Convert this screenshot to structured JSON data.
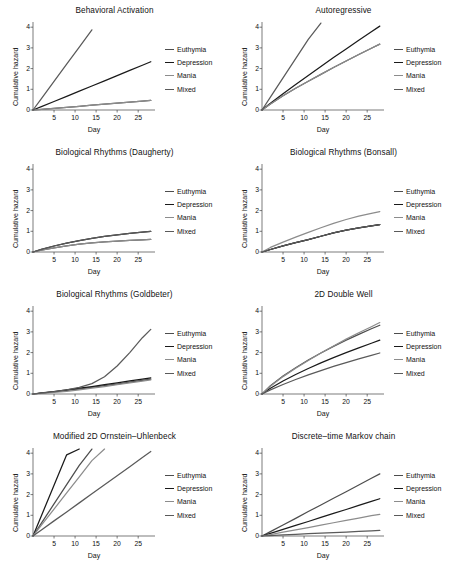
{
  "figure": {
    "width": 458,
    "height": 570,
    "background": "#ffffff"
  },
  "series_colors": {
    "Euthymia": "#4d4d4d",
    "Depression": "#1a1a1a",
    "Mania": "#8c8c8c",
    "Mixed": "#5a5a5a"
  },
  "legend": {
    "position": "right",
    "entries": [
      "Euthymia",
      "Depression",
      "Mania",
      "Mixed"
    ]
  },
  "axes": {
    "xlabel": "Day",
    "ylabel": "Cumulative hazard",
    "xticks": [
      5,
      10,
      15,
      20,
      25
    ],
    "yticks": [
      0,
      1,
      2,
      3,
      4
    ],
    "xlim": [
      0,
      29
    ],
    "ylim": [
      0,
      4.25
    ],
    "grid": false
  },
  "chart_data": [
    {
      "type": "line",
      "title": "Behavioral Activation",
      "xlabel": "Day",
      "ylabel": "Cumulative hazard",
      "xlim": [
        0,
        29
      ],
      "ylim": [
        0,
        4.25
      ],
      "xticks": [
        5,
        10,
        15,
        20,
        25
      ],
      "yticks": [
        0,
        1,
        2,
        3,
        4
      ],
      "grid": false,
      "legend": [
        "Euthymia",
        "Depression",
        "Mania",
        "Mixed"
      ],
      "x": [
        0,
        2,
        5,
        8,
        11,
        14,
        17,
        20,
        23,
        26,
        28
      ],
      "series": [
        {
          "name": "Euthymia",
          "values": [
            0,
            0.03,
            0.08,
            0.13,
            0.18,
            0.23,
            0.28,
            0.33,
            0.38,
            0.43,
            0.46
          ]
        },
        {
          "name": "Depression",
          "values": [
            0,
            0.16,
            0.41,
            0.66,
            0.91,
            1.16,
            1.41,
            1.66,
            1.91,
            2.16,
            2.33
          ]
        },
        {
          "name": "Mania",
          "values": [
            0,
            0.03,
            0.08,
            0.13,
            0.18,
            0.23,
            0.28,
            0.33,
            0.38,
            0.43,
            0.46
          ]
        },
        {
          "name": "Mixed",
          "values": [
            0,
            0.55,
            1.38,
            2.21,
            3.04,
            3.87,
            null,
            null,
            null,
            null,
            null
          ]
        }
      ]
    },
    {
      "type": "line",
      "title": "Autoregressive",
      "xlabel": "Day",
      "ylabel": "Cumulative hazard",
      "xlim": [
        0,
        29
      ],
      "ylim": [
        0,
        4.25
      ],
      "xticks": [
        5,
        10,
        15,
        20,
        25
      ],
      "yticks": [
        0,
        1,
        2,
        3,
        4
      ],
      "grid": false,
      "legend": [
        "Euthymia",
        "Depression",
        "Mania",
        "Mixed"
      ],
      "x": [
        0,
        2,
        5,
        8,
        11,
        14,
        17,
        20,
        23,
        26,
        28
      ],
      "series": [
        {
          "name": "Euthymia",
          "values": [
            0,
            0.29,
            0.69,
            1.05,
            1.39,
            1.72,
            2.05,
            2.37,
            2.68,
            2.98,
            3.18
          ]
        },
        {
          "name": "Depression",
          "values": [
            0,
            0.33,
            0.79,
            1.23,
            1.67,
            2.1,
            2.53,
            2.95,
            3.37,
            3.78,
            4.05
          ]
        },
        {
          "name": "Mania",
          "values": [
            0,
            0.29,
            0.69,
            1.05,
            1.39,
            1.72,
            2.05,
            2.37,
            2.68,
            2.98,
            3.18
          ]
        },
        {
          "name": "Mixed",
          "values": [
            0,
            0.62,
            1.55,
            2.48,
            3.41,
            4.2,
            null,
            null,
            null,
            null,
            null
          ]
        }
      ]
    },
    {
      "type": "line",
      "title": "Biological Rhythms (Daugherty)",
      "xlabel": "Day",
      "ylabel": "Cumulative hazard",
      "xlim": [
        0,
        29
      ],
      "ylim": [
        0,
        4.25
      ],
      "xticks": [
        5,
        10,
        15,
        20,
        25
      ],
      "yticks": [
        0,
        1,
        2,
        3,
        4
      ],
      "grid": false,
      "legend": [
        "Euthymia",
        "Depression",
        "Mania",
        "Mixed"
      ],
      "x": [
        0,
        2,
        5,
        8,
        11,
        14,
        17,
        20,
        23,
        26,
        28
      ],
      "series": [
        {
          "name": "Euthymia",
          "values": [
            0,
            0.09,
            0.2,
            0.3,
            0.38,
            0.44,
            0.49,
            0.53,
            0.56,
            0.59,
            0.61
          ]
        },
        {
          "name": "Depression",
          "values": [
            0,
            0.13,
            0.29,
            0.43,
            0.55,
            0.66,
            0.75,
            0.83,
            0.9,
            0.96,
            1.0
          ]
        },
        {
          "name": "Mania",
          "values": [
            0,
            0.09,
            0.2,
            0.3,
            0.38,
            0.44,
            0.49,
            0.53,
            0.56,
            0.59,
            0.61
          ]
        },
        {
          "name": "Mixed",
          "values": [
            0,
            0.13,
            0.29,
            0.43,
            0.55,
            0.66,
            0.75,
            0.83,
            0.9,
            0.96,
            1.0
          ]
        }
      ]
    },
    {
      "type": "line",
      "title": "Biological Rhythms (Bonsall)",
      "xlabel": "Day",
      "ylabel": "Cumulative hazard",
      "xlim": [
        0,
        29
      ],
      "ylim": [
        0,
        4.25
      ],
      "xticks": [
        5,
        10,
        15,
        20,
        25
      ],
      "yticks": [
        0,
        1,
        2,
        3,
        4
      ],
      "grid": false,
      "legend": [
        "Euthymia",
        "Depression",
        "Mania",
        "Mixed"
      ],
      "x": [
        0,
        2,
        5,
        8,
        11,
        14,
        17,
        20,
        23,
        26,
        28
      ],
      "series": [
        {
          "name": "Euthymia",
          "values": [
            0,
            0.12,
            0.3,
            0.45,
            0.6,
            0.76,
            0.92,
            1.06,
            1.17,
            1.26,
            1.32
          ]
        },
        {
          "name": "Depression",
          "values": [
            0,
            0.12,
            0.3,
            0.45,
            0.6,
            0.76,
            0.92,
            1.06,
            1.17,
            1.26,
            1.32
          ]
        },
        {
          "name": "Mania",
          "values": [
            0,
            0.22,
            0.48,
            0.72,
            0.95,
            1.17,
            1.38,
            1.57,
            1.73,
            1.87,
            1.95
          ]
        },
        {
          "name": "Mixed",
          "values": [
            0,
            0.12,
            0.3,
            0.45,
            0.6,
            0.76,
            0.92,
            1.06,
            1.17,
            1.26,
            1.32
          ]
        }
      ]
    },
    {
      "type": "line",
      "title": "Biological Rhythms (Goldbeter)",
      "xlabel": "Day",
      "ylabel": "Cumulative hazard",
      "xlim": [
        0,
        29
      ],
      "ylim": [
        0,
        4.25
      ],
      "xticks": [
        5,
        10,
        15,
        20,
        25
      ],
      "yticks": [
        0,
        1,
        2,
        3,
        4
      ],
      "grid": false,
      "legend": [
        "Euthymia",
        "Depression",
        "Mania",
        "Mixed"
      ],
      "x": [
        0,
        2,
        5,
        8,
        11,
        14,
        17,
        20,
        23,
        26,
        28
      ],
      "series": [
        {
          "name": "Euthymia",
          "values": [
            0,
            0.04,
            0.1,
            0.17,
            0.24,
            0.32,
            0.4,
            0.48,
            0.57,
            0.66,
            0.72
          ]
        },
        {
          "name": "Depression",
          "values": [
            0,
            0.05,
            0.12,
            0.2,
            0.28,
            0.36,
            0.45,
            0.54,
            0.63,
            0.72,
            0.78
          ]
        },
        {
          "name": "Mania",
          "values": [
            0,
            0.03,
            0.08,
            0.13,
            0.2,
            0.28,
            0.36,
            0.45,
            0.54,
            0.62,
            0.68
          ]
        },
        {
          "name": "Mixed",
          "values": [
            0,
            0.04,
            0.11,
            0.2,
            0.32,
            0.5,
            0.83,
            1.35,
            2.0,
            2.72,
            3.12
          ]
        }
      ]
    },
    {
      "type": "line",
      "title": "2D Double Well",
      "xlabel": "Day",
      "ylabel": "Cumulative hazard",
      "xlim": [
        0,
        29
      ],
      "ylim": [
        0,
        4.25
      ],
      "xticks": [
        5,
        10,
        15,
        20,
        25
      ],
      "yticks": [
        0,
        1,
        2,
        3,
        4
      ],
      "grid": false,
      "legend": [
        "Euthymia",
        "Depression",
        "Mania",
        "Mixed"
      ],
      "x": [
        0,
        2,
        5,
        8,
        11,
        14,
        17,
        20,
        23,
        26,
        28
      ],
      "series": [
        {
          "name": "Euthymia",
          "values": [
            0,
            0.4,
            0.87,
            1.27,
            1.64,
            1.98,
            2.3,
            2.6,
            2.88,
            3.15,
            3.32
          ]
        },
        {
          "name": "Depression",
          "values": [
            0,
            0.28,
            0.63,
            0.94,
            1.23,
            1.5,
            1.76,
            2.0,
            2.23,
            2.45,
            2.6
          ]
        },
        {
          "name": "Mania",
          "values": [
            0,
            0.38,
            0.84,
            1.24,
            1.62,
            1.98,
            2.32,
            2.65,
            2.96,
            3.25,
            3.45
          ]
        },
        {
          "name": "Mixed",
          "values": [
            0,
            0.2,
            0.46,
            0.7,
            0.92,
            1.13,
            1.33,
            1.52,
            1.7,
            1.87,
            1.98
          ]
        }
      ]
    },
    {
      "type": "line",
      "title": "Modified 2D Ornstein–Uhlenbeck",
      "xlabel": "Day",
      "ylabel": "Cumulative hazard",
      "xlim": [
        0,
        29
      ],
      "ylim": [
        0,
        4.25
      ],
      "xticks": [
        5,
        10,
        15,
        20,
        25
      ],
      "yticks": [
        0,
        1,
        2,
        3,
        4
      ],
      "grid": false,
      "legend": [
        "Euthymia",
        "Depression",
        "Mania",
        "Mixed"
      ],
      "x": [
        0,
        2,
        5,
        8,
        11,
        14,
        17,
        20,
        23,
        26,
        28
      ],
      "series": [
        {
          "name": "Euthymia",
          "values": [
            0,
            0.62,
            1.55,
            2.48,
            3.41,
            4.2,
            null,
            null,
            null,
            null,
            null
          ]
        },
        {
          "name": "Depression",
          "values": [
            0,
            0.98,
            2.45,
            3.92,
            4.2,
            null,
            null,
            null,
            null,
            null,
            null
          ]
        },
        {
          "name": "Mania",
          "values": [
            0,
            0.52,
            1.3,
            2.08,
            2.86,
            3.64,
            4.2,
            null,
            null,
            null,
            null
          ]
        },
        {
          "name": "Mixed",
          "values": [
            0,
            0.29,
            0.73,
            1.16,
            1.6,
            2.04,
            2.48,
            2.91,
            3.35,
            3.79,
            4.08
          ]
        }
      ]
    },
    {
      "type": "line",
      "title": "Discrete–time Markov chain",
      "xlabel": "Day",
      "ylabel": "Cumulative hazard",
      "xlim": [
        0,
        29
      ],
      "ylim": [
        0,
        4.25
      ],
      "xticks": [
        5,
        10,
        15,
        20,
        25
      ],
      "yticks": [
        0,
        1,
        2,
        3,
        4
      ],
      "grid": false,
      "legend": [
        "Euthymia",
        "Depression",
        "Mania",
        "Mixed"
      ],
      "x": [
        0,
        2,
        5,
        8,
        11,
        14,
        17,
        20,
        23,
        26,
        28
      ],
      "series": [
        {
          "name": "Euthymia",
          "values": [
            0,
            0.21,
            0.53,
            0.85,
            1.18,
            1.5,
            1.82,
            2.14,
            2.46,
            2.79,
            3.0
          ]
        },
        {
          "name": "Depression",
          "values": [
            0,
            0.13,
            0.32,
            0.51,
            0.7,
            0.9,
            1.09,
            1.28,
            1.48,
            1.67,
            1.8
          ]
        },
        {
          "name": "Mania",
          "values": [
            0,
            0.07,
            0.19,
            0.3,
            0.41,
            0.52,
            0.64,
            0.75,
            0.86,
            0.98,
            1.05
          ]
        },
        {
          "name": "Mixed",
          "values": [
            0,
            0.02,
            0.05,
            0.08,
            0.11,
            0.14,
            0.16,
            0.19,
            0.22,
            0.25,
            0.27
          ]
        }
      ]
    }
  ]
}
